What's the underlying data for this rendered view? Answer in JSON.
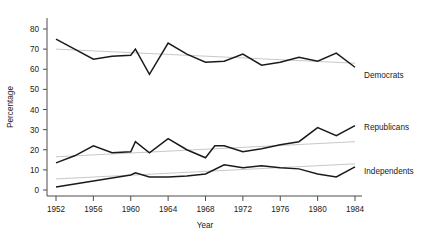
{
  "chart_data": {
    "type": "line",
    "title": "",
    "xlabel": "Year",
    "ylabel": "Percentage",
    "xlim": [
      1952,
      1984
    ],
    "ylim": [
      0,
      85
    ],
    "xticks": [
      1952,
      1956,
      1960,
      1964,
      1968,
      1972,
      1976,
      1980,
      1984
    ],
    "xtick_labels": [
      "1952",
      "1956",
      "1960",
      "1964",
      "1968",
      "1972",
      "1976",
      "1980",
      "1984"
    ],
    "yticks": [
      0,
      10,
      20,
      30,
      40,
      50,
      60,
      70,
      80
    ],
    "ytick_labels": [
      "0",
      "10",
      "20",
      "30",
      "40",
      "50",
      "60",
      "70",
      "80"
    ],
    "grid": false,
    "legend_position": "right-inline-labels",
    "x": [
      1952,
      1954,
      1956,
      1958,
      1960,
      1960.5,
      1962,
      1964,
      1966,
      1968,
      1970,
      1972,
      1974,
      1976,
      1978,
      1980,
      1982,
      1984
    ],
    "series": [
      {
        "name": "Democrats",
        "color": "#1a1a1a",
        "values": [
          75,
          70,
          65,
          66.5,
          67,
          70,
          57.5,
          73,
          67.5,
          63.5,
          64,
          67.5,
          62,
          63.5,
          66,
          64,
          68,
          61
        ],
        "trend_start": 70.0,
        "trend_end": 63.0
      },
      {
        "name": "Republicans",
        "color": "#1a1a1a",
        "values": [
          13.5,
          17,
          22,
          18.5,
          19,
          24,
          18.5,
          25.5,
          20,
          16,
          19.5,
          22,
          21.5,
          19,
          23,
          25,
          23.5,
          22.5
        ],
        "trend_start": 16.5,
        "trend_end": 24.0
      },
      {
        "name": "Independents",
        "color": "#1a1a1a",
        "values": [
          1.5,
          3,
          4.5,
          6,
          7.5,
          8.5,
          6.5,
          6.5,
          7,
          8,
          9.5,
          11,
          9.5,
          11,
          13,
          11.5,
          13.5,
          15
        ],
        "trend_start": 5.5,
        "trend_end": 13.0
      }
    ],
    "series_extra": {
      "Republicans_x": [
        1952,
        1954,
        1956,
        1958,
        1960,
        1960.5,
        1962,
        1964,
        1966,
        1968,
        1969,
        1970,
        1972,
        1974,
        1976,
        1978,
        1980,
        1982,
        1984
      ],
      "Republicans_y": [
        13.5,
        17,
        22,
        18.5,
        19,
        24,
        18.5,
        25.5,
        20,
        16,
        22,
        22,
        19,
        20.5,
        22.5,
        24,
        31,
        27,
        32
      ],
      "Democrats_x": [
        1952,
        1954,
        1956,
        1958,
        1960,
        1960.5,
        1962,
        1964,
        1966,
        1968,
        1970,
        1972,
        1974,
        1976,
        1978,
        1980,
        1982,
        1984
      ],
      "Democrats_y": [
        75,
        70,
        65,
        66.5,
        67,
        70,
        57.5,
        73,
        67.5,
        63.5,
        64,
        67.5,
        62,
        63.5,
        66,
        64,
        68,
        61
      ],
      "Independents_x": [
        1952,
        1954,
        1956,
        1958,
        1960,
        1960.5,
        1962,
        1964,
        1966,
        1968,
        1970,
        1972,
        1974,
        1976,
        1978,
        1980,
        1982,
        1984
      ],
      "Independents_y": [
        1.5,
        3,
        4.5,
        6,
        7.5,
        8.5,
        6.5,
        6.5,
        7,
        8,
        12.5,
        11,
        12,
        11,
        10.5,
        8,
        6.5,
        11.5
      ]
    },
    "annotations": [
      "Democrats",
      "Republicans",
      "Independents"
    ],
    "line_color": "#1a1a1a",
    "trend_color": "#c8c8c8"
  },
  "axes": {
    "ylabel": "Percentage",
    "xlabel": "Year"
  },
  "labels": {
    "democrats": "Democrats",
    "republicans": "Republicans",
    "independents": "Independents"
  },
  "ticks": {
    "y": [
      "80",
      "70",
      "60",
      "50",
      "40",
      "30",
      "20",
      "10",
      "0"
    ],
    "x": [
      "1952",
      "1956",
      "1960",
      "1964",
      "1968",
      "1972",
      "1976",
      "1980",
      "1984"
    ]
  }
}
